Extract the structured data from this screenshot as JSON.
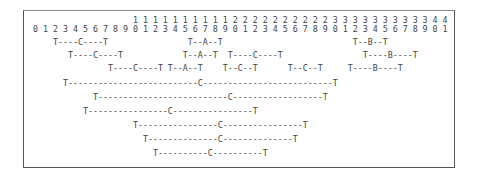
{
  "diagram": {
    "type": "ascii-interval-diagram",
    "index_header": {
      "tens": "                    1 1 1 1 1 1 1 1 1 1 2 2 2 2 2 2 2 2 2 2 3 3 3 3 3 3 3 3 3 3 4 4",
      "ones": "0 1 2 3 4 5 6 7 8 9 0 1 2 3 4 5 6 7 8 9 0 1 2 3 4 5 6 7 8 9 0 1 2 3 4 5 6 7 8 9 0 1",
      "range": [
        0,
        41
      ]
    },
    "rows": [
      "    T----C----T                T--A--T                          T--B--T",
      "       T----C----T            T--A--T  T----C----T                T----B----T",
      "               T----C----T T--A--T    T--C--T      T--C--T     T----B----T",
      "      T--------------------------C--------------------------T",
      "            T--------------------------C------------------T",
      "          T----------------C----------------T",
      "                    T----------------C----------------T",
      "                      T--------------C--------------T",
      "                        T----------C----------T"
    ],
    "segments": [
      {
        "row": 1,
        "label": "C",
        "start_col": 4,
        "end_col": 14
      },
      {
        "row": 1,
        "label": "A",
        "start_col": 31,
        "end_col": 37
      },
      {
        "row": 1,
        "label": "B",
        "start_col": 64,
        "end_col": 70
      },
      {
        "row": 2,
        "label": "C",
        "start_col": 7,
        "end_col": 17
      },
      {
        "row": 2,
        "label": "A",
        "start_col": 30,
        "end_col": 36
      },
      {
        "row": 2,
        "label": "C",
        "start_col": 39,
        "end_col": 49
      },
      {
        "row": 2,
        "label": "B",
        "start_col": 66,
        "end_col": 76
      },
      {
        "row": 3,
        "label": "C",
        "start_col": 15,
        "end_col": 25
      },
      {
        "row": 3,
        "label": "A",
        "start_col": 27,
        "end_col": 33
      },
      {
        "row": 3,
        "label": "C",
        "start_col": 38,
        "end_col": 44
      },
      {
        "row": 3,
        "label": "C",
        "start_col": 51,
        "end_col": 57
      },
      {
        "row": 3,
        "label": "B",
        "start_col": 63,
        "end_col": 73
      },
      {
        "row": 4,
        "label": "C",
        "start_col": 6,
        "end_col": 60
      },
      {
        "row": 5,
        "label": "C",
        "start_col": 12,
        "end_col": 58
      },
      {
        "row": 6,
        "label": "C",
        "start_col": 10,
        "end_col": 44
      },
      {
        "row": 7,
        "label": "C",
        "start_col": 20,
        "end_col": 54
      },
      {
        "row": 8,
        "label": "C",
        "start_col": 22,
        "end_col": 52
      },
      {
        "row": 9,
        "label": "C",
        "start_col": 24,
        "end_col": 46
      }
    ]
  }
}
